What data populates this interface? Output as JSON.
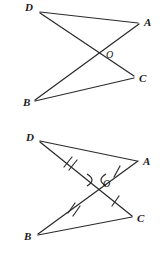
{
  "figure": {
    "background_color": "#ffffff",
    "stroke_color": "#2b2b2b",
    "label_color": "#1a1a1a",
    "diagrams": [
      {
        "id": "top",
        "caption": "Unmarked figure: segments DC and BA intersect at O",
        "points": {
          "D": {
            "label": "D",
            "x": 38,
            "y": 11
          },
          "A": {
            "label": "A",
            "x": 140,
            "y": 22
          },
          "O": {
            "label": "O",
            "x": 102,
            "y": 51
          },
          "C": {
            "label": "C",
            "x": 135,
            "y": 76
          },
          "B": {
            "label": "B",
            "x": 34,
            "y": 101
          }
        },
        "segments": [
          {
            "name": "DA",
            "from": "D",
            "to": "A"
          },
          {
            "name": "DC",
            "from": "D",
            "to": "C"
          },
          {
            "name": "BA",
            "from": "B",
            "to": "A"
          },
          {
            "name": "BC",
            "from": "B",
            "to": "C"
          }
        ],
        "tick_marks": [],
        "angle_marks": []
      },
      {
        "id": "bottom",
        "caption": "Marked figure: DO congruent to BO (double ticks), OA congruent to OC (single ticks), vertical angles at O marked",
        "points": {
          "D": {
            "label": "D",
            "x": 38,
            "y": 11
          },
          "A": {
            "label": "A",
            "x": 139,
            "y": 31
          },
          "O": {
            "label": "O",
            "x": 98,
            "y": 51
          },
          "C": {
            "label": "C",
            "x": 133,
            "y": 87
          },
          "B": {
            "label": "B",
            "x": 37,
            "y": 106
          }
        },
        "segments": [
          {
            "name": "DA",
            "from": "D",
            "to": "A"
          },
          {
            "name": "DC",
            "from": "D",
            "to": "C"
          },
          {
            "name": "BA",
            "from": "B",
            "to": "A"
          },
          {
            "name": "BC",
            "from": "B",
            "to": "C"
          }
        ],
        "tick_marks": [
          {
            "name": "tick-DO",
            "segment": "DO",
            "count": 2,
            "t": 0.45
          },
          {
            "name": "tick-OA",
            "segment": "OA",
            "count": 1,
            "t": 0.45
          },
          {
            "name": "tick-BO",
            "segment": "BO",
            "count": 2,
            "t": 0.57
          },
          {
            "name": "tick-OC",
            "segment": "OC",
            "count": 1,
            "t": 0.42
          }
        ],
        "angle_marks": [
          {
            "name": "vertical-angle-left",
            "at": "O",
            "side": "left"
          },
          {
            "name": "vertical-angle-right",
            "at": "O",
            "side": "right"
          }
        ]
      }
    ]
  }
}
